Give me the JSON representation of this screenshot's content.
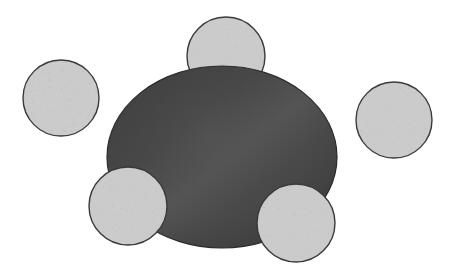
{
  "figure": {
    "canvas": {
      "width": 458,
      "height": 273,
      "background_color": "#ffffff"
    },
    "palette": {
      "background": "#ffffff",
      "ellipse_fill_dark": "#3f3f3f",
      "ellipse_fill_mid": "#4c4c4c",
      "ellipse_fill_light": "#5a5a5a",
      "ellipse_stroke": "#2b2b2b",
      "circle_fill_base": "#9a9a9a",
      "circle_speckle_light": "#d4d4d4",
      "circle_speckle_dark": "#5e5e5e",
      "circle_stroke": "#3a3a3a"
    },
    "shapes": [
      {
        "id": "top-circle",
        "label": "Top speckled circle",
        "type": "circle",
        "texture": "speckled",
        "cx": 226,
        "cy": 56,
        "r": 39,
        "layer": 1
      },
      {
        "id": "central-ellipse",
        "label": "Central dark ellipse",
        "type": "ellipse",
        "texture": "smooth-gradient",
        "cx": 222,
        "cy": 157,
        "rx": 115,
        "ry": 91,
        "layer": 2
      },
      {
        "id": "left-circle",
        "label": "Left speckled circle",
        "type": "circle",
        "texture": "speckled",
        "cx": 61,
        "cy": 98,
        "r": 38,
        "layer": 3
      },
      {
        "id": "right-circle",
        "label": "Right speckled circle",
        "type": "circle",
        "texture": "speckled",
        "cx": 394,
        "cy": 120,
        "r": 38,
        "layer": 3
      },
      {
        "id": "bottom-left-circle",
        "label": "Bottom left speckled circle",
        "type": "circle",
        "texture": "speckled",
        "cx": 128,
        "cy": 206,
        "r": 39,
        "layer": 4
      },
      {
        "id": "bottom-right-circle",
        "label": "Bottom right speckled circle",
        "type": "circle",
        "texture": "speckled",
        "cx": 296,
        "cy": 223,
        "r": 39,
        "layer": 4
      }
    ]
  }
}
